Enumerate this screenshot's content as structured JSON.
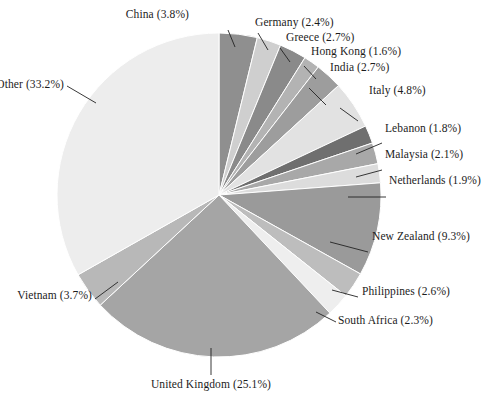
{
  "chart_data": {
    "type": "pie",
    "title": "",
    "xlabel": "",
    "ylabel": "",
    "units": "percent",
    "legend_position": "callout-labels",
    "grid": false,
    "start_angle_deg": 0,
    "direction": "clockwise",
    "categories": [
      "China",
      "Germany",
      "Greece",
      "Hong Kong",
      "India",
      "Italy",
      "Lebanon",
      "Malaysia",
      "Netherlands",
      "New Zealand",
      "Philippines",
      "South Africa",
      "United Kingdom",
      "Vietnam",
      "Other"
    ],
    "values": [
      3.8,
      2.4,
      2.7,
      1.6,
      2.7,
      4.8,
      1.8,
      2.1,
      1.9,
      9.3,
      2.6,
      2.3,
      25.1,
      3.7,
      33.2
    ],
    "labels": [
      "China (3.8%)",
      "Germany (2.4%)",
      "Greece (2.7%)",
      "Hong Kong (1.6%)",
      "India (2.7%)",
      "Italy (4.8%)",
      "Lebanon (1.8%)",
      "Malaysia (2.1%)",
      "Netherlands (1.9%)",
      "New Zealand (9.3%)",
      "Philippines (2.6%)",
      "South Africa (2.3%)",
      "United Kingdom (25.1%)",
      "Vietnam (3.7%)",
      "Other (33.2%)"
    ],
    "colors": [
      "#8f8f8f",
      "#cfcfcf",
      "#8a8a8a",
      "#b3b3b3",
      "#9d9d9d",
      "#e2e2e2",
      "#6f6f6f",
      "#a8a8a8",
      "#dcdcdc",
      "#9a9a9a",
      "#bdbdbd",
      "#eeeeee",
      "#a5a5a5",
      "#b8b8b8",
      "#ededed"
    ],
    "geometry": {
      "center_x": 219,
      "center_y": 195,
      "radius": 162
    },
    "leader_lines": [
      {
        "category": "China",
        "x1": 235,
        "y1": 47,
        "x2": 228,
        "y2": 30,
        "label_x": 189,
        "label_y": 8,
        "align": "right"
      },
      {
        "category": "Germany",
        "x1": 268,
        "y1": 50,
        "x2": 258,
        "y2": 33,
        "label_x": 255,
        "label_y": 16,
        "align": "left"
      },
      {
        "category": "Greece",
        "x1": 290,
        "y1": 62,
        "x2": 280,
        "y2": 48,
        "label_x": 286,
        "label_y": 31,
        "align": "left"
      },
      {
        "category": "Hong Kong",
        "x1": 316,
        "y1": 79,
        "x2": 304,
        "y2": 66,
        "label_x": 311,
        "label_y": 45,
        "align": "left"
      },
      {
        "category": "India",
        "x1": 326,
        "y1": 105,
        "x2": 309,
        "y2": 88,
        "label_x": 330,
        "label_y": 61,
        "align": "left"
      },
      {
        "category": "Italy",
        "x1": 358,
        "y1": 121,
        "x2": 340,
        "y2": 108,
        "label_x": 369,
        "label_y": 84,
        "align": "left"
      },
      {
        "category": "Lebanon",
        "x1": 356,
        "y1": 154,
        "x2": 382,
        "y2": 143,
        "label_x": 385,
        "label_y": 122,
        "align": "left"
      },
      {
        "category": "Malaysia",
        "x1": 356,
        "y1": 177,
        "x2": 382,
        "y2": 170,
        "label_x": 385,
        "label_y": 148,
        "align": "left"
      },
      {
        "category": "Netherlands",
        "x1": 348,
        "y1": 197,
        "x2": 386,
        "y2": 197,
        "label_x": 389,
        "label_y": 174,
        "align": "left"
      },
      {
        "category": "New Zealand",
        "x1": 330,
        "y1": 242,
        "x2": 368,
        "y2": 252,
        "label_x": 372,
        "label_y": 230,
        "align": "left"
      },
      {
        "category": "Philippines",
        "x1": 332,
        "y1": 290,
        "x2": 358,
        "y2": 297,
        "label_x": 362,
        "label_y": 285,
        "align": "left"
      },
      {
        "category": "South Africa",
        "x1": 316,
        "y1": 312,
        "x2": 336,
        "y2": 322,
        "label_x": 338,
        "label_y": 314,
        "align": "left"
      },
      {
        "category": "United Kingdom",
        "x1": 211,
        "y1": 348,
        "x2": 211,
        "y2": 375,
        "label_x": 211,
        "label_y": 378,
        "align": "center"
      },
      {
        "category": "Vietnam",
        "x1": 118,
        "y1": 282,
        "x2": 95,
        "y2": 299,
        "label_x": 92,
        "label_y": 289,
        "align": "right"
      },
      {
        "category": "Other",
        "x1": 96,
        "y1": 103,
        "x2": 67,
        "y2": 86,
        "label_x": 64,
        "label_y": 78,
        "align": "right"
      }
    ]
  }
}
